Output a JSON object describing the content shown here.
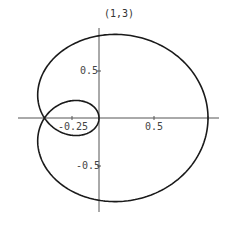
{
  "chart_data": {
    "type": "line",
    "subtype": "polar-parametric",
    "title": "(1,3)",
    "equation": "r = cos(theta/3), theta in [0, 3*pi]",
    "theta_range": [
      0,
      9.42477796
    ],
    "key_points": [
      {
        "x": 1.0,
        "y": 0.0
      },
      {
        "x": 0.0,
        "y": 0.866
      },
      {
        "x": -0.5,
        "y": 0.0
      },
      {
        "x": 0.0,
        "y": -0.866
      },
      {
        "x": 0.0,
        "y": 0.0
      }
    ],
    "xlabel": "",
    "ylabel": "",
    "xlim": [
      -0.75,
      1.1
    ],
    "ylim": [
      -0.95,
      0.95
    ],
    "x_ticks": [
      -0.25,
      0.5,
      1
    ],
    "x_tick_labels": [
      "-0.25",
      "0.5",
      ""
    ],
    "y_ticks": [
      0.5,
      -0.5
    ],
    "y_tick_labels": [
      "0.5",
      "-0.5"
    ],
    "grid": false,
    "legend": null
  },
  "labels": {
    "title": "(1,3)",
    "x_neg": "-0.25",
    "x_pos": "0.5",
    "y_pos": "0.5",
    "y_neg": "-0.5"
  },
  "layout": {
    "origin_px": [
      99,
      118
    ],
    "x_scale": 109,
    "y_scale": 95,
    "stroke": "#1a1a1a",
    "axis_color": "#555555"
  }
}
